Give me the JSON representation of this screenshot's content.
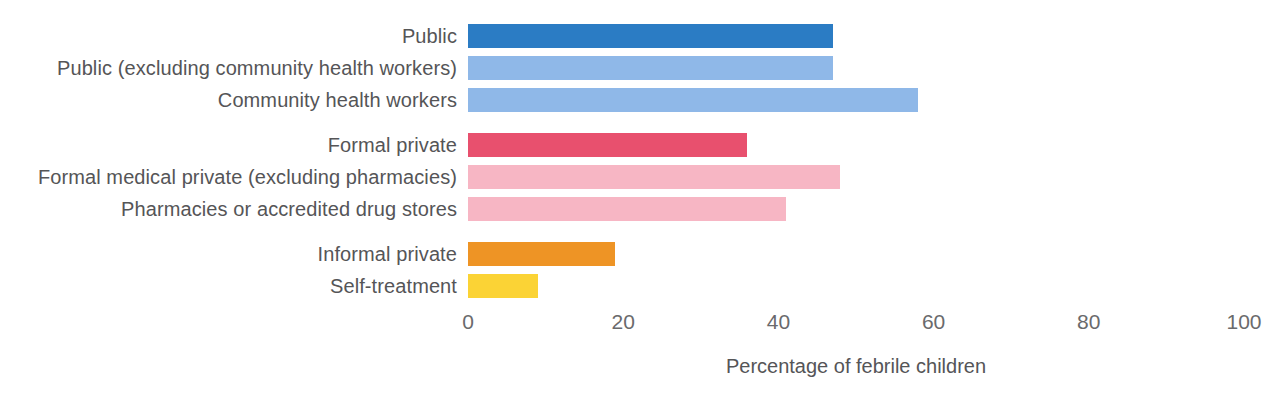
{
  "chart_data": {
    "type": "bar",
    "orientation": "horizontal",
    "title": "",
    "xlabel": "Percentage of febrile children",
    "ylabel": "",
    "xlim": [
      0,
      100
    ],
    "xticks": [
      0,
      20,
      40,
      60,
      80,
      100
    ],
    "xtick_labels": [
      "0",
      "20",
      "40",
      "60",
      "80",
      "100"
    ],
    "grid": false,
    "legend": "none",
    "categories": [
      "Public",
      "Public (excluding community health workers)",
      "Community health workers",
      "Formal private",
      "Formal medical private (excluding pharmacies)",
      "Pharmacies or accredited drug stores",
      "Informal private",
      "Self-treatment"
    ],
    "values": [
      47,
      47,
      58,
      36,
      48,
      41,
      19,
      9
    ],
    "bars": [
      {
        "label": "Public",
        "value": 47,
        "color": "#2B7CC4",
        "group": "public",
        "y": 22
      },
      {
        "label": "Public (excluding community health workers)",
        "value": 47,
        "color": "#8FB8E8",
        "group": "public",
        "y": 54
      },
      {
        "label": "Community health workers",
        "value": 58,
        "color": "#8FB8E8",
        "group": "public",
        "y": 86
      },
      {
        "label": "Formal private",
        "value": 36,
        "color": "#E8506E",
        "group": "formal-private",
        "y": 131
      },
      {
        "label": "Formal medical private (excluding pharmacies)",
        "value": 48,
        "color": "#F7B6C4",
        "group": "formal-private",
        "y": 163
      },
      {
        "label": "Pharmacies or accredited drug stores",
        "value": 41,
        "color": "#F7B6C4",
        "group": "formal-private",
        "y": 195
      },
      {
        "label": "Informal private",
        "value": 19,
        "color": "#EE9425",
        "group": "informal-private",
        "y": 240
      },
      {
        "label": "Self-treatment",
        "value": 9,
        "color": "#FBD335",
        "group": "self-treatment",
        "y": 272
      }
    ],
    "colors": {
      "public_primary": "#2B7CC4",
      "public_secondary": "#8FB8E8",
      "formal_private_primary": "#E8506E",
      "formal_private_secondary": "#F7B6C4",
      "informal_private": "#EE9425",
      "self_treatment": "#FBD335",
      "text": "#555557",
      "background": "#ffffff"
    }
  }
}
